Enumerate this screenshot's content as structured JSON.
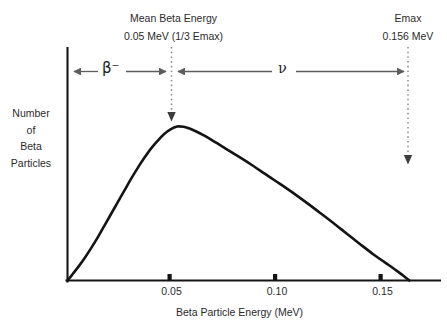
{
  "figure": {
    "background": "#ffffff",
    "ink_color": "#141414",
    "axis_color": "#1a1a1a",
    "dotted_color": "#8c8c8c",
    "arrow_color": "#5d5d5d"
  },
  "annotations": {
    "mean": {
      "title": "Mean Beta Energy",
      "value": "0.05 MeV (1/3 Emax)",
      "marker_energy": 0.05
    },
    "emax": {
      "title": "Emax",
      "value": "0.156 MeV",
      "marker_energy": 0.156
    },
    "regions": [
      {
        "symbol": "β⁻",
        "name": "beta-minus",
        "from": 0.0,
        "to": 0.05
      },
      {
        "symbol": "ν",
        "name": "neutrino",
        "from": 0.05,
        "to": 0.156
      }
    ]
  },
  "axes": {
    "x_title": "Beta Particle Energy (MeV)",
    "y_title_lines": [
      "Number",
      "of",
      "Beta",
      "Particles"
    ],
    "x_ticks": [
      "0.05",
      "0.10",
      "0.15"
    ]
  },
  "chart_data": {
    "type": "line",
    "xlabel": "Beta Particle Energy (MeV)",
    "ylabel": "Number of Beta Particles",
    "xlim": [
      0,
      0.17
    ],
    "ylim": [
      0,
      1.08
    ],
    "grid": false,
    "legend": null,
    "xticks": [
      0.05,
      0.1,
      0.15
    ],
    "xticklabels": [
      "0.05",
      "0.10",
      "0.15"
    ],
    "yticks": [],
    "annotations": [
      {
        "label": "Mean Beta Energy",
        "sublabel": "0.05 MeV (1/3 Emax)",
        "x": 0.05
      },
      {
        "label": "Emax",
        "sublabel": "0.156 MeV",
        "x": 0.156
      },
      {
        "label": "β⁻",
        "span": [
          0.0,
          0.05
        ]
      },
      {
        "label": "ν",
        "span": [
          0.05,
          0.156
        ]
      }
    ],
    "series": [
      {
        "name": "Beta emission spectrum",
        "x": [
          0.0,
          0.002,
          0.005,
          0.008,
          0.011,
          0.014,
          0.017,
          0.02,
          0.023,
          0.026,
          0.029,
          0.032,
          0.035,
          0.038,
          0.041,
          0.044,
          0.047,
          0.05,
          0.053,
          0.056,
          0.059,
          0.062,
          0.065,
          0.07,
          0.075,
          0.08,
          0.085,
          0.09,
          0.095,
          0.1,
          0.105,
          0.11,
          0.115,
          0.12,
          0.125,
          0.13,
          0.135,
          0.14,
          0.145,
          0.15,
          0.153,
          0.156
        ],
        "y": [
          0.0,
          0.035,
          0.09,
          0.15,
          0.215,
          0.285,
          0.36,
          0.435,
          0.51,
          0.585,
          0.66,
          0.73,
          0.795,
          0.855,
          0.905,
          0.95,
          0.982,
          1.0,
          0.998,
          0.985,
          0.966,
          0.944,
          0.92,
          0.876,
          0.832,
          0.788,
          0.742,
          0.694,
          0.646,
          0.598,
          0.548,
          0.496,
          0.442,
          0.388,
          0.332,
          0.276,
          0.22,
          0.166,
          0.116,
          0.066,
          0.034,
          0.0
        ]
      }
    ]
  }
}
